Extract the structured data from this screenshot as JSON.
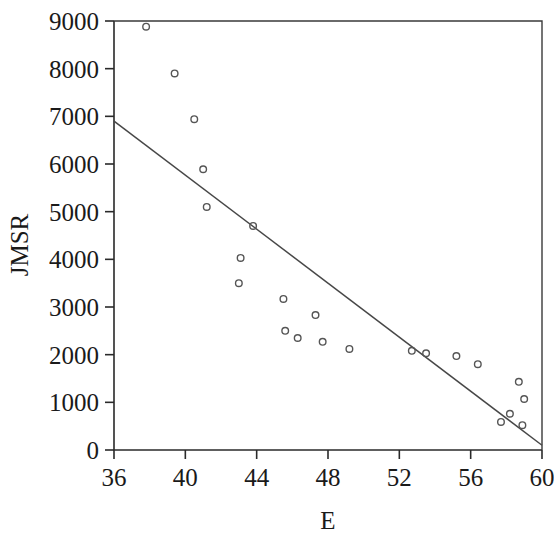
{
  "chart_data": {
    "type": "scatter",
    "title": "",
    "subtitle": "",
    "xlabel": "E",
    "ylabel": "JMSR",
    "xlim": [
      36,
      60
    ],
    "ylim": [
      0,
      9000
    ],
    "xticks": [
      36,
      40,
      44,
      48,
      52,
      56,
      60
    ],
    "yticks": [
      0,
      1000,
      2000,
      3000,
      4000,
      5000,
      6000,
      7000,
      8000,
      9000
    ],
    "xtick_labels": [
      "36",
      "40",
      "44",
      "48",
      "52",
      "56",
      "60"
    ],
    "ytick_labels": [
      "0",
      "1000",
      "2000",
      "3000",
      "4000",
      "5000",
      "6000",
      "7000",
      "8000",
      "9000"
    ],
    "grid": false,
    "legend": false,
    "legend_position": "none",
    "marker_style": "open-circle",
    "marker_color": "#555555",
    "line_color": "#474747",
    "axis_color": "#2a2a2a",
    "series": [
      {
        "name": "observations",
        "type": "scatter",
        "points": [
          {
            "x": 37.8,
            "y": 8880
          },
          {
            "x": 39.4,
            "y": 7900
          },
          {
            "x": 40.5,
            "y": 6940
          },
          {
            "x": 41.0,
            "y": 5890
          },
          {
            "x": 41.2,
            "y": 5100
          },
          {
            "x": 43.8,
            "y": 4700
          },
          {
            "x": 43.1,
            "y": 4030
          },
          {
            "x": 43.0,
            "y": 3500
          },
          {
            "x": 45.5,
            "y": 3170
          },
          {
            "x": 47.3,
            "y": 2830
          },
          {
            "x": 45.6,
            "y": 2500
          },
          {
            "x": 46.3,
            "y": 2350
          },
          {
            "x": 47.7,
            "y": 2270
          },
          {
            "x": 49.2,
            "y": 2120
          },
          {
            "x": 52.7,
            "y": 2080
          },
          {
            "x": 53.5,
            "y": 2030
          },
          {
            "x": 55.2,
            "y": 1970
          },
          {
            "x": 56.4,
            "y": 1800
          },
          {
            "x": 58.7,
            "y": 1430
          },
          {
            "x": 59.0,
            "y": 1070
          },
          {
            "x": 58.2,
            "y": 760
          },
          {
            "x": 57.7,
            "y": 590
          },
          {
            "x": 58.9,
            "y": 520
          }
        ]
      },
      {
        "name": "regression-line",
        "type": "line",
        "endpoints": [
          {
            "x": 36.0,
            "y": 6900
          },
          {
            "x": 60.0,
            "y": 100
          }
        ]
      }
    ]
  }
}
